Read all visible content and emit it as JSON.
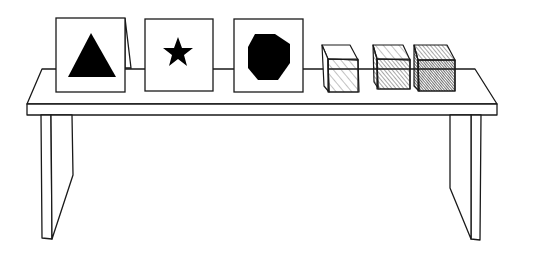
{
  "scene": {
    "title": "Table with shape cards and shaded cubes",
    "cards": [
      {
        "shape": "triangle",
        "fill": "#000000"
      },
      {
        "shape": "star",
        "fill": "#000000"
      },
      {
        "shape": "octagon",
        "fill": "#000000"
      }
    ],
    "cubes": [
      {
        "shading": "light"
      },
      {
        "shading": "medium"
      },
      {
        "shading": "dark"
      }
    ],
    "colors": {
      "ink": "#1a1a1a",
      "paper": "#ffffff"
    }
  }
}
